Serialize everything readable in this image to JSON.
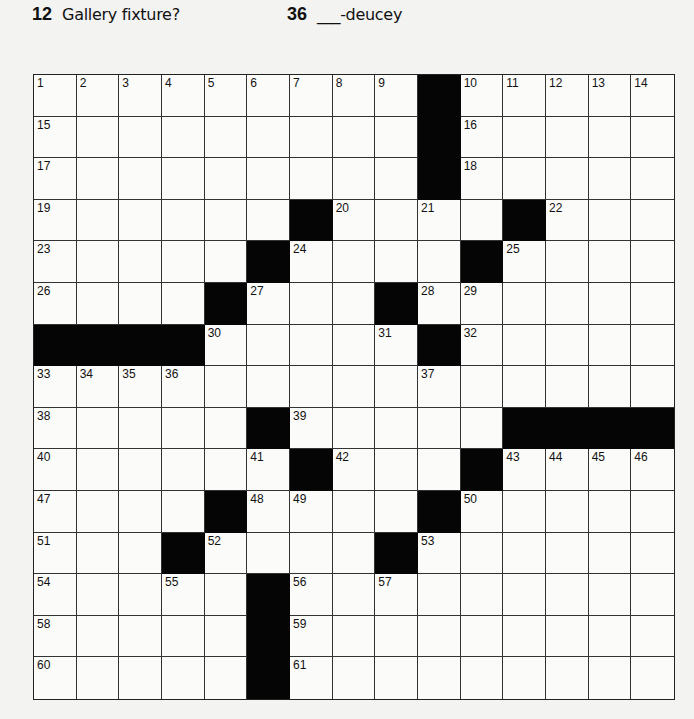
{
  "clues_visible": [
    {
      "number": "12",
      "text": "Gallery fixture?"
    },
    {
      "number": "36",
      "text": "___-deucey"
    }
  ],
  "grid": {
    "rows": 15,
    "cols": 15,
    "layout": [
      [
        "1",
        "2",
        "3",
        "4",
        "5",
        "6",
        "7",
        "8",
        "9",
        "#",
        "10",
        "11",
        "12",
        "13",
        "14"
      ],
      [
        "15",
        "",
        "",
        "",
        "",
        "",
        "",
        "",
        "",
        "#",
        "16",
        "",
        "",
        "",
        ""
      ],
      [
        "17",
        "",
        "",
        "",
        "",
        "",
        "",
        "",
        "",
        "#",
        "18",
        "",
        "",
        "",
        ""
      ],
      [
        "19",
        "",
        "",
        "",
        "",
        "",
        "#",
        "20",
        "",
        "21",
        "",
        "#",
        "22",
        "",
        ""
      ],
      [
        "23",
        "",
        "",
        "",
        "",
        "#",
        "24",
        "",
        "",
        "",
        "#",
        "25",
        "",
        "",
        ""
      ],
      [
        "26",
        "",
        "",
        "",
        "#",
        "27",
        "",
        "",
        "#",
        "28",
        "29",
        "",
        "",
        "",
        ""
      ],
      [
        "#",
        "#",
        "#",
        "#",
        "30",
        "",
        "",
        "",
        "31",
        "#",
        "32",
        "",
        "",
        "",
        ""
      ],
      [
        "33",
        "34",
        "35",
        "36",
        "",
        "",
        "",
        "",
        "",
        "37",
        "",
        "",
        "",
        "",
        ""
      ],
      [
        "38",
        "",
        "",
        "",
        "",
        "#",
        "39",
        "",
        "",
        "",
        "",
        "#",
        "#",
        "#",
        "#"
      ],
      [
        "40",
        "",
        "",
        "",
        "",
        "41",
        "#",
        "42",
        "",
        "",
        "#",
        "43",
        "44",
        "45",
        "46"
      ],
      [
        "47",
        "",
        "",
        "",
        "#",
        "48",
        "49",
        "",
        "",
        "#",
        "50",
        "",
        "",
        "",
        ""
      ],
      [
        "51",
        "",
        "",
        "#",
        "52",
        "",
        "",
        "",
        "#",
        "53",
        "",
        "",
        "",
        "",
        ""
      ],
      [
        "54",
        "",
        "",
        "55",
        "",
        "#",
        "56",
        "",
        "57",
        "",
        "",
        "",
        "",
        "",
        ""
      ],
      [
        "58",
        "",
        "",
        "",
        "",
        "#",
        "59",
        "",
        "",
        "",
        "",
        "",
        "",
        "",
        ""
      ],
      [
        "60",
        "",
        "",
        "",
        "",
        "#",
        "61",
        "",
        "",
        "",
        "",
        "",
        "",
        "",
        ""
      ]
    ]
  },
  "colors": {
    "black_square": "#050505",
    "grid_line": "#333333",
    "background": "#f3f3f1"
  }
}
